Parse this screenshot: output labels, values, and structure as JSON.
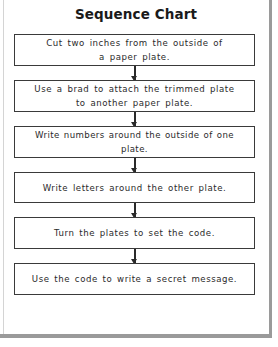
{
  "title": "Sequence Chart",
  "steps": [
    {
      "line1": "Cut two inches from the outside of",
      "line2": "a paper plate."
    },
    {
      "line1": "Use a brad to attach the trimmed plate",
      "line2": "to another paper plate."
    },
    {
      "line1": "Write numbers around the outside of one plate.",
      "line2": ""
    },
    {
      "line1": "Write letters around the other plate.",
      "line2": ""
    },
    {
      "line1": "Turn the plates to set the code.",
      "line2": ""
    },
    {
      "line1": "Use the code to write a secret message.",
      "line2": ""
    }
  ],
  "colors": {
    "box_border": "#3a3a3a",
    "frame": "#9a9a9a",
    "text": "#2a2a2a"
  }
}
